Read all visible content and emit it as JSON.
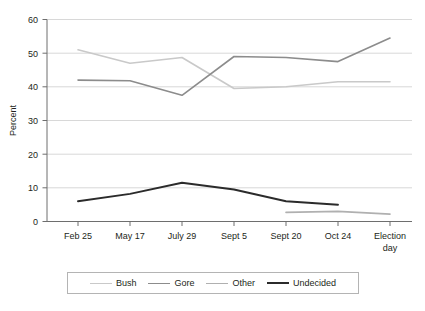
{
  "chart_data": {
    "type": "line",
    "title": "",
    "xlabel": "",
    "ylabel": "Percent",
    "ylim": [
      0,
      60
    ],
    "yticks": [
      0,
      10,
      20,
      30,
      40,
      50,
      60
    ],
    "grid": true,
    "legend_position": "bottom",
    "categories": [
      "Feb 25",
      "May 17",
      "July 29",
      "Sept 5",
      "Sept 20",
      "Oct 24",
      "Election day"
    ],
    "series": [
      {
        "name": "Bush",
        "color": "#c9c9c9",
        "values": [
          51.0,
          47.0,
          48.7,
          39.5,
          40.0,
          41.5,
          41.5
        ]
      },
      {
        "name": "Gore",
        "color": "#8c8c8c",
        "values": [
          42.0,
          41.8,
          37.5,
          49.0,
          48.7,
          47.5,
          54.5
        ]
      },
      {
        "name": "Other",
        "color": "#b0b0b0",
        "values": [
          null,
          null,
          null,
          null,
          2.7,
          3.0,
          2.2
        ]
      },
      {
        "name": "Undecided",
        "color": "#2b2b2b",
        "values": [
          6.0,
          8.2,
          11.5,
          9.5,
          6.0,
          5.0,
          null
        ]
      }
    ]
  },
  "axis": {
    "y_label": "Percent",
    "y_ticks": [
      "0",
      "10",
      "20",
      "30",
      "40",
      "50",
      "60"
    ],
    "x_ticks": [
      "Feb 25",
      "May 17",
      "July 29",
      "Sept 5",
      "Sept 20",
      "Oct 24",
      "Election day"
    ],
    "x_tick_last_line1": "Election",
    "x_tick_last_line2": "day"
  },
  "legend": {
    "items": [
      {
        "label": "Bush",
        "color": "#c9c9c9"
      },
      {
        "label": "Gore",
        "color": "#8c8c8c"
      },
      {
        "label": "Other",
        "color": "#b0b0b0"
      },
      {
        "label": "Undecided",
        "color": "#2b2b2b"
      }
    ]
  },
  "caption": {
    "text": ""
  },
  "colors": {
    "axis": "#6e6e6e",
    "gridline": "#d8d8d8",
    "text": "#231f20",
    "legend_border": "#b4b4b4"
  }
}
